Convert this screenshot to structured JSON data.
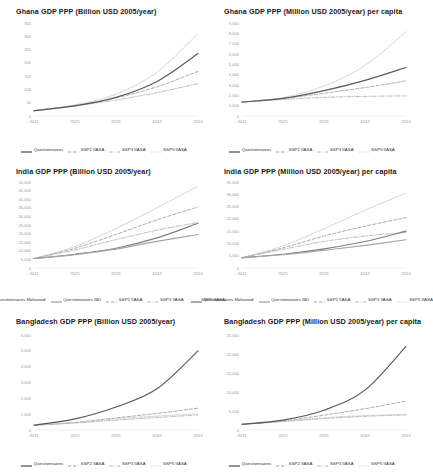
{
  "figure": {
    "layout": "2 columns x 3 rows of line charts",
    "x_ticks": [
      "2011",
      "2021",
      "2031",
      "2041",
      "2051"
    ]
  },
  "series_styles": {
    "questionnaires": {
      "color": "#595959",
      "dash": "solid"
    },
    "questionnaires_mahanadi": {
      "color": "#7f7f7f",
      "dash": "solid"
    },
    "questionnaires_ibd": {
      "color": "#a6a6a6",
      "dash": "solid"
    },
    "ssp2": {
      "color": "#9a9a9a",
      "dash": "dashed"
    },
    "ssp3": {
      "color": "#b0b0b0",
      "dash": "dashdot"
    },
    "ssp5": {
      "color": "#bfbfbf",
      "dash": "dotted"
    }
  },
  "charts": [
    {
      "id": "ghana-billion",
      "title": "Ghana GDP PPP (Billion USD 2005/year)",
      "ylim": [
        0,
        350
      ],
      "yticks": [
        "0",
        "50",
        "100",
        "150",
        "200",
        "250",
        "300",
        "350"
      ],
      "legend": [
        "Questionnaires",
        "SSP2 IIASA",
        "SSP3 IIASA",
        "SSP5 IIASA"
      ],
      "chart_data": {
        "type": "line",
        "title": "Ghana GDP PPP (Billion USD 2005/year)",
        "xlabel": "",
        "ylabel": "Billion USD 2005/year",
        "x": [
          2011,
          2021,
          2031,
          2041,
          2051
        ],
        "xlim": [
          2011,
          2051
        ],
        "ylim": [
          0,
          350
        ],
        "grid": false,
        "legend_position": "bottom",
        "series": [
          {
            "name": "Questionnaires",
            "values": [
              20,
              38,
              70,
              130,
              235
            ]
          },
          {
            "name": "SSP2 IIASA",
            "values": [
              20,
              40,
              68,
              110,
              168
            ]
          },
          {
            "name": "SSP3 IIASA",
            "values": [
              20,
              38,
              60,
              88,
              122
            ]
          },
          {
            "name": "SSP5 IIASA",
            "values": [
              20,
              42,
              82,
              165,
              310
            ]
          }
        ]
      }
    },
    {
      "id": "ghana-percapita",
      "title": "Ghana GDP PPP (Million USD 2005/year) per capita",
      "ylim": [
        0,
        9000
      ],
      "yticks": [
        "0",
        "1,000",
        "2,000",
        "3,000",
        "4,000",
        "5,000",
        "6,000",
        "7,000",
        "8,000",
        "9,000"
      ],
      "legend": [
        "Questionnaires",
        "SSP2 IIASA",
        "SSP3 IIASA",
        "SSP5 IIASA"
      ],
      "chart_data": {
        "type": "line",
        "title": "Ghana GDP PPP (Million USD 2005/year) per capita",
        "xlabel": "",
        "ylabel": "Million USD 2005/year per capita",
        "x": [
          2011,
          2021,
          2031,
          2041,
          2051
        ],
        "xlim": [
          2011,
          2051
        ],
        "ylim": [
          0,
          9000
        ],
        "grid": false,
        "legend_position": "bottom",
        "series": [
          {
            "name": "Questionnaires",
            "values": [
              1350,
              1700,
              2450,
              3450,
              4700
            ]
          },
          {
            "name": "SSP2 IIASA",
            "values": [
              1350,
              1700,
              2200,
              2750,
              3400
            ]
          },
          {
            "name": "SSP3 IIASA",
            "values": [
              1350,
              1600,
              1800,
              1900,
              1950
            ]
          },
          {
            "name": "SSP5 IIASA",
            "values": [
              1350,
              1800,
              2900,
              4900,
              8150
            ]
          }
        ]
      }
    },
    {
      "id": "india-billion",
      "title": "India GDP PPP (Billion USD 2005/year)",
      "ylim": [
        0,
        50000
      ],
      "yticks": [
        "0",
        "5,000",
        "10,000",
        "15,000",
        "20,000",
        "25,000",
        "30,000",
        "35,000",
        "40,000",
        "45,000",
        "50,000"
      ],
      "legend": [
        "Questionnaires Mahanadi",
        "Questionnaires IBD",
        "SSP2 IIASA",
        "SSP3 IIASA",
        "SSP5 IIASA"
      ],
      "chart_data": {
        "type": "line",
        "title": "India GDP PPP (Billion USD 2005/year)",
        "xlabel": "",
        "ylabel": "Billion USD 2005/year",
        "x": [
          2011,
          2021,
          2031,
          2041,
          2051
        ],
        "xlim": [
          2011,
          2051
        ],
        "ylim": [
          0,
          50000
        ],
        "grid": false,
        "legend_position": "bottom",
        "series": [
          {
            "name": "Questionnaires Mahanadi",
            "values": [
              5500,
              8000,
              11500,
              17500,
              26000
            ]
          },
          {
            "name": "Questionnaires IBD",
            "values": [
              5500,
              7800,
              11000,
              15500,
              19500
            ]
          },
          {
            "name": "SSP2 IIASA",
            "values": [
              5500,
              11500,
              19500,
              28000,
              35500
            ]
          },
          {
            "name": "SSP3 IIASA",
            "values": [
              5500,
              10500,
              16500,
              22000,
              26500
            ]
          },
          {
            "name": "SSP5 IIASA",
            "values": [
              5500,
              12500,
              23000,
              35000,
              47500
            ]
          }
        ]
      }
    },
    {
      "id": "india-percapita",
      "title": "India GDP PPP (Million USD 2005/year) per capita",
      "ylim": [
        0,
        35000
      ],
      "yticks": [
        "0",
        "5,000",
        "10,000",
        "15,000",
        "20,000",
        "25,000",
        "30,000",
        "35,000"
      ],
      "legend": [
        "Questionnaires Mahanadi",
        "Questionnaires IBD",
        "SSP2 IIASA",
        "SSP3 IIASA",
        "SSP5 IIASA"
      ],
      "chart_data": {
        "type": "line",
        "title": "India GDP PPP (Million USD 2005/year) per capita",
        "xlabel": "",
        "ylabel": "Million USD 2005/year per capita",
        "x": [
          2011,
          2021,
          2031,
          2041,
          2051
        ],
        "xlim": [
          2011,
          2051
        ],
        "ylim": [
          0,
          35000
        ],
        "grid": false,
        "legend_position": "bottom",
        "series": [
          {
            "name": "Questionnaires Mahanadi",
            "values": [
              4200,
              5600,
              7800,
              10800,
              15000
            ]
          },
          {
            "name": "Questionnaires IBD",
            "values": [
              4200,
              5400,
              7200,
              9200,
              11500
            ]
          },
          {
            "name": "SSP2 IIASA",
            "values": [
              4200,
              8200,
              13000,
              17000,
              20500
            ]
          },
          {
            "name": "SSP3 IIASA",
            "values": [
              4200,
              7600,
              10800,
              13000,
              14500
            ]
          },
          {
            "name": "SSP5 IIASA",
            "values": [
              4200,
              9000,
              16000,
              23500,
              30500
            ]
          }
        ]
      }
    },
    {
      "id": "bangladesh-billion",
      "title": "Bangladesh GDP PPP (Billion USD 2005/year)",
      "ylim": [
        0,
        6000
      ],
      "yticks": [
        "0",
        "1,000",
        "2,000",
        "3,000",
        "4,000",
        "5,000",
        "6,000"
      ],
      "legend": [
        "Questionnaires",
        "SSP2 IIASA",
        "SSP3 IIASA",
        "SSP5 IIASA"
      ],
      "chart_data": {
        "type": "line",
        "title": "Bangladesh GDP PPP (Billion USD 2005/year)",
        "xlabel": "",
        "ylabel": "Billion USD 2005/year",
        "x": [
          2011,
          2021,
          2031,
          2041,
          2051
        ],
        "xlim": [
          2011,
          2051
        ],
        "ylim": [
          0,
          6000
        ],
        "grid": false,
        "legend_position": "bottom",
        "series": [
          {
            "name": "Questionnaires",
            "values": [
              300,
              700,
              1450,
              2600,
              5000
            ]
          },
          {
            "name": "SSP2 IIASA",
            "values": [
              300,
              480,
              760,
              1050,
              1380
            ]
          },
          {
            "name": "SSP3 IIASA",
            "values": [
              300,
              440,
              620,
              790,
              950
            ]
          },
          {
            "name": "SSP5 IIASA",
            "values": [
              300,
              470,
              700,
              880,
              1020
            ]
          }
        ]
      }
    },
    {
      "id": "bangladesh-percapita",
      "title": "Bangladesh GDP PPP (Million USD 2005/year) per capita",
      "ylim": [
        0,
        25000
      ],
      "yticks": [
        "0",
        "5,000",
        "10,000",
        "15,000",
        "20,000",
        "25,000"
      ],
      "legend": [
        "Questionnaires",
        "SSP2 IIASA",
        "SSP3 IIASA",
        "SSP5 IIASA"
      ],
      "chart_data": {
        "type": "line",
        "title": "Bangladesh GDP PPP (Million USD 2005/year) per capita",
        "xlabel": "",
        "ylabel": "Million USD 2005/year per capita",
        "x": [
          2011,
          2021,
          2031,
          2041,
          2051
        ],
        "xlim": [
          2011,
          2051
        ],
        "ylim": [
          0,
          25000
        ],
        "grid": false,
        "legend_position": "bottom",
        "series": [
          {
            "name": "Questionnaires",
            "values": [
              1500,
              2600,
              5200,
              10500,
              22000
            ]
          },
          {
            "name": "SSP2 IIASA",
            "values": [
              1500,
              2400,
              3900,
              5600,
              7600
            ]
          },
          {
            "name": "SSP3 IIASA",
            "values": [
              1500,
              2200,
              3000,
              3600,
              4000
            ]
          },
          {
            "name": "SSP5 IIASA",
            "values": [
              1500,
              2300,
              3200,
              3800,
              4100
            ]
          }
        ]
      }
    }
  ]
}
